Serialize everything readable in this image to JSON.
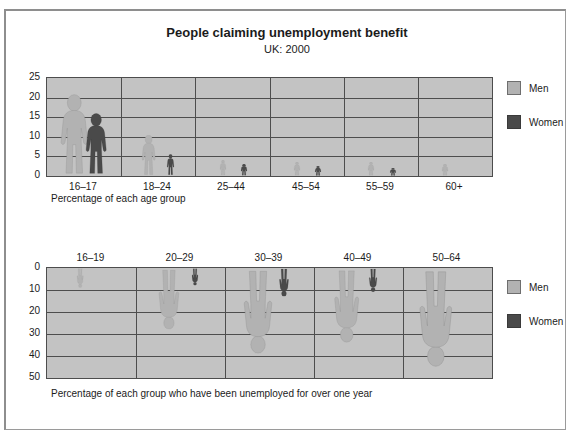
{
  "header": {
    "title": "People claiming unemployment benefit",
    "subtitle": "UK: 2000"
  },
  "legend": {
    "men_label": "Men",
    "women_label": "Women",
    "men_color": "#b2b2b2",
    "women_color": "#4a4a4a"
  },
  "chart_data": [
    {
      "id": "chart-top",
      "type": "bar",
      "title": "People claiming unemployment benefit",
      "subtitle": "UK: 2000",
      "xlabel": "Percentage of each age group",
      "ylabel": "",
      "categories": [
        "16–17",
        "18–24",
        "25–44",
        "45–54",
        "55–59",
        "60+"
      ],
      "yticks": [
        25,
        20,
        15,
        10,
        5,
        0
      ],
      "ylim": [
        0,
        25
      ],
      "y_inverted": false,
      "grid": true,
      "legend_position": "right",
      "series": [
        {
          "name": "Men",
          "values": [
            21,
            10.5,
            4,
            3.5,
            3.5,
            3
          ]
        },
        {
          "name": "Women",
          "values": [
            16,
            5.5,
            3,
            2.5,
            2,
            0
          ]
        }
      ]
    },
    {
      "id": "chart-bottom",
      "type": "bar",
      "title": "",
      "xlabel": "Percentage of each group who have been unemployed for over one year",
      "ylabel": "",
      "categories": [
        "16–19",
        "20–29",
        "30–39",
        "40–49",
        "50–64"
      ],
      "yticks": [
        0,
        10,
        20,
        30,
        40,
        50
      ],
      "ylim": [
        0,
        50
      ],
      "y_inverted": true,
      "grid": true,
      "legend_position": "right",
      "series": [
        {
          "name": "Men",
          "values": [
            9,
            28,
            39,
            34,
            45
          ]
        },
        {
          "name": "Women",
          "values": [
            0,
            8,
            13,
            11,
            0
          ]
        }
      ]
    }
  ]
}
